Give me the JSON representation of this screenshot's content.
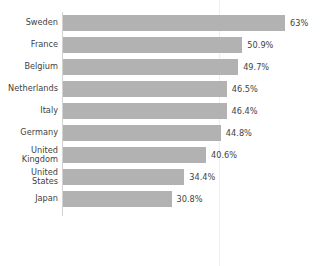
{
  "chart_data": {
    "type": "bar",
    "orientation": "horizontal",
    "title": "",
    "xlabel": "",
    "ylabel": "",
    "grid": true,
    "legend": "none",
    "xlim": [
      0,
      70
    ],
    "categories": [
      "Sweden",
      "France",
      "Belgium",
      "Netherlands",
      "Italy",
      "Germany",
      "United\nKingdom",
      "United\nStates",
      "Japan"
    ],
    "values": [
      63,
      50.9,
      49.7,
      46.5,
      46.4,
      44.8,
      40.6,
      34.4,
      30.8
    ],
    "data_labels": [
      "63%",
      "50.9%",
      "49.7%",
      "46.5%",
      "46.4%",
      "44.8%",
      "40.6%",
      "34.4%",
      "30.8%"
    ],
    "bar_color": "#b2b2b2",
    "text_color": "#3f3f3f",
    "gridline_color": "#eeeeef",
    "axis_color": "#d2d2d2",
    "background": "#ffffff"
  },
  "gridline": {
    "value": 45.2,
    "left_px": 219
  },
  "title_remnant": "· · · ·"
}
